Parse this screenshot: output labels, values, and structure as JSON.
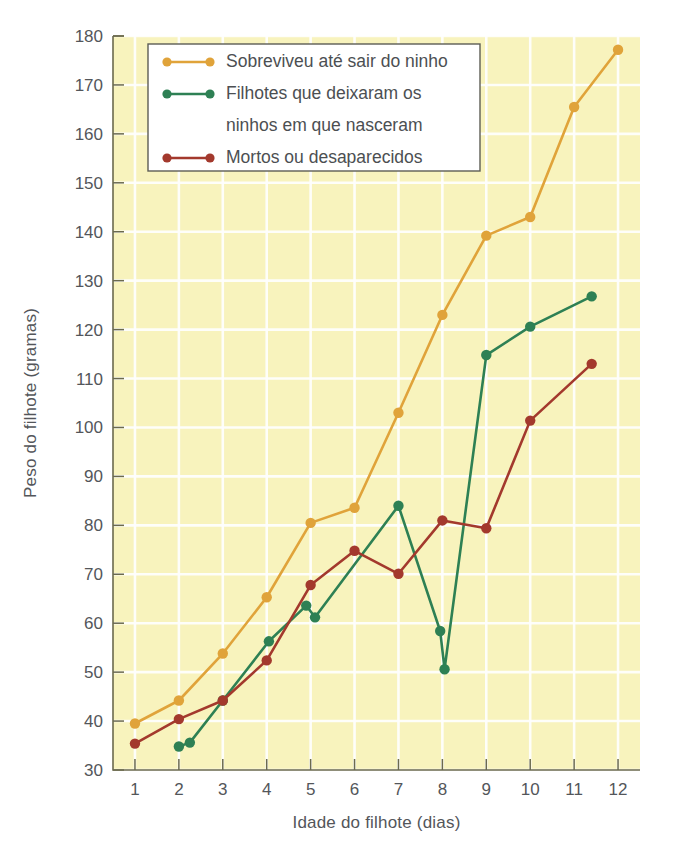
{
  "chart_data": {
    "type": "line",
    "title": "",
    "xlabel": "Idade do filhote (dias)",
    "ylabel": "Peso do filhote (gramas)",
    "xlim": [
      0.5,
      12.5
    ],
    "ylim": [
      30,
      180
    ],
    "xticks": [
      1,
      2,
      3,
      4,
      5,
      6,
      7,
      8,
      9,
      10,
      11,
      12
    ],
    "yticks": [
      30,
      40,
      50,
      60,
      70,
      80,
      90,
      100,
      110,
      120,
      130,
      140,
      150,
      160,
      170,
      180
    ],
    "grid": true,
    "legend_position": "top-left",
    "series": [
      {
        "name": "Sobreviveu até sair do ninho",
        "color": "#e0a33a",
        "points": [
          {
            "x": 1.0,
            "y": 39.5
          },
          {
            "x": 2.0,
            "y": 44.2
          },
          {
            "x": 3.0,
            "y": 53.8
          },
          {
            "x": 4.0,
            "y": 65.3
          },
          {
            "x": 5.0,
            "y": 80.5
          },
          {
            "x": 6.0,
            "y": 83.6
          },
          {
            "x": 7.0,
            "y": 103.0
          },
          {
            "x": 8.0,
            "y": 123.0
          },
          {
            "x": 9.0,
            "y": 139.2
          },
          {
            "x": 10.0,
            "y": 143.0
          },
          {
            "x": 11.0,
            "y": 165.5
          },
          {
            "x": 12.0,
            "y": 177.2
          }
        ]
      },
      {
        "name": "Filhotes que deixaram os ninhos em que nasceram",
        "color": "#2e8054",
        "points": [
          {
            "x": 2.0,
            "y": 34.8
          },
          {
            "x": 2.25,
            "y": 35.6
          },
          {
            "x": 3.0,
            "y": 44.2
          },
          {
            "x": 4.05,
            "y": 56.3
          },
          {
            "x": 4.9,
            "y": 63.6
          },
          {
            "x": 5.1,
            "y": 61.2
          },
          {
            "x": 7.0,
            "y": 84.0
          },
          {
            "x": 7.95,
            "y": 58.4
          },
          {
            "x": 8.05,
            "y": 50.6
          },
          {
            "x": 9.0,
            "y": 114.8
          },
          {
            "x": 10.0,
            "y": 120.6
          },
          {
            "x": 11.4,
            "y": 126.8
          }
        ]
      },
      {
        "name": "Mortos ou desaparecidos",
        "color": "#a3392d",
        "points": [
          {
            "x": 1.0,
            "y": 35.4
          },
          {
            "x": 2.0,
            "y": 40.4
          },
          {
            "x": 3.0,
            "y": 44.2
          },
          {
            "x": 4.0,
            "y": 52.4
          },
          {
            "x": 5.0,
            "y": 67.8
          },
          {
            "x": 6.0,
            "y": 74.8
          },
          {
            "x": 7.0,
            "y": 70.1
          },
          {
            "x": 8.0,
            "y": 81.0
          },
          {
            "x": 9.0,
            "y": 79.4
          },
          {
            "x": 10.0,
            "y": 101.4
          },
          {
            "x": 11.4,
            "y": 113.0
          }
        ]
      }
    ]
  },
  "legend": {
    "entries": [
      {
        "label": "Sobreviveu até sair do ninho",
        "color": "#e0a33a"
      },
      {
        "label": "Filhotes que deixaram os",
        "color": "#2e8054"
      },
      {
        "label": "ninhos em que nasceram",
        "color": ""
      },
      {
        "label": "Mortos ou desaparecidos",
        "color": "#a3392d"
      }
    ]
  },
  "style": {
    "plot_background": "#f8f3bd",
    "gridline_color": "#ffffff",
    "axis_color": "#6b6a4e",
    "text_color": "#53565a",
    "page_background": "#ffffff"
  }
}
